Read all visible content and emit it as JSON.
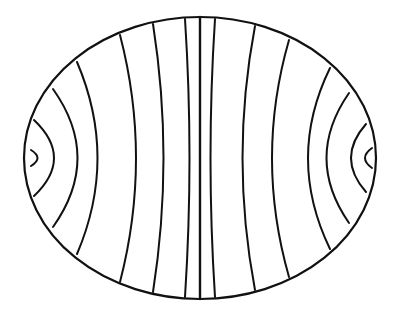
{
  "figure": {
    "stroke_color": "#111111",
    "background": "#ffffff",
    "ellipse": {
      "cx": 200,
      "cy": 158,
      "rx": 176,
      "ry": 141
    },
    "field_lines": [
      {
        "id": "l-cap",
        "d": "M 31 150 Q 44 158 31 166"
      },
      {
        "id": "l-1",
        "d": "M 34 120 Q 74 158 34 196"
      },
      {
        "id": "l-2",
        "d": "M 53 89 Q 102 158 53 227"
      },
      {
        "id": "l-3",
        "d": "M 77 62 Q 118 158 77 254"
      },
      {
        "id": "l-4",
        "d": "M 120 35 Q 152 158 120 282"
      },
      {
        "id": "l-5",
        "d": "M 153 24 Q 174 158 153 292"
      },
      {
        "id": "l-6",
        "d": "M 185 19 Q 194 158 185 297"
      },
      {
        "id": "center",
        "d": "M 200 17 L 200 299"
      },
      {
        "id": "r-6",
        "d": "M 215 19 Q 206 158 215 297"
      },
      {
        "id": "r-5",
        "d": "M 255 26 Q 230 158 255 290"
      },
      {
        "id": "r-4",
        "d": "M 289 40 Q 255 158 289 277"
      },
      {
        "id": "r-3",
        "d": "M 330 68 Q 286 158 330 249"
      },
      {
        "id": "r-2",
        "d": "M 349 93 Q 304 158 349 223"
      },
      {
        "id": "r-1",
        "d": "M 366 124 Q 336 158 366 192"
      },
      {
        "id": "r-cap",
        "d": "M 372 148 Q 358 158 372 168"
      }
    ]
  }
}
